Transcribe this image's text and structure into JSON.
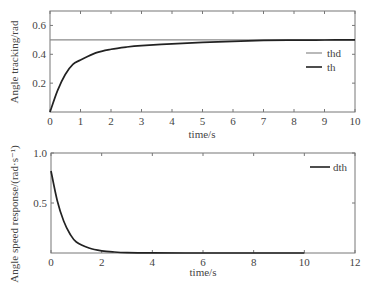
{
  "chart_data": [
    {
      "type": "line",
      "title": "",
      "xlabel": "time/s",
      "ylabel": "Angle tracking/rad",
      "xlim": [
        0,
        10
      ],
      "ylim": [
        0,
        0.7
      ],
      "xticks": [
        0,
        1,
        2,
        3,
        4,
        5,
        6,
        7,
        8,
        9,
        10
      ],
      "yticks": [
        0.2,
        0.4,
        0.6
      ],
      "grid": false,
      "legend_position": "right-middle",
      "series": [
        {
          "name": "thd",
          "color": "#8a8a8a",
          "x": [
            0,
            10
          ],
          "y": [
            0.5,
            0.5
          ]
        },
        {
          "name": "th",
          "color": "#222222",
          "x": [
            0,
            0.25,
            0.5,
            0.75,
            1,
            1.5,
            2,
            2.5,
            3,
            4,
            5,
            6,
            7,
            8,
            9,
            10
          ],
          "y": [
            0,
            0.15,
            0.26,
            0.33,
            0.36,
            0.41,
            0.435,
            0.45,
            0.46,
            0.472,
            0.482,
            0.49,
            0.496,
            0.498,
            0.499,
            0.5
          ]
        }
      ]
    },
    {
      "type": "line",
      "title": "",
      "xlabel": "time/s",
      "ylabel": "Angle speed response/(rad·s⁻¹)",
      "xlim": [
        0,
        12
      ],
      "ylim": [
        0,
        1.0
      ],
      "xticks": [
        0,
        2,
        4,
        6,
        8,
        10,
        12
      ],
      "yticks": [
        0.5,
        1.0
      ],
      "grid": false,
      "legend_position": "upper-right",
      "series": [
        {
          "name": "dth",
          "color": "#222222",
          "x": [
            0,
            0.25,
            0.5,
            0.75,
            1,
            1.5,
            2,
            2.5,
            3,
            4,
            6,
            8,
            10
          ],
          "y": [
            0.82,
            0.52,
            0.32,
            0.19,
            0.11,
            0.05,
            0.022,
            0.01,
            0.004,
            0.001,
            0,
            0,
            0
          ]
        }
      ]
    }
  ],
  "plots": {
    "top": {
      "ylabel": "Angle tracking/rad",
      "xlabel": "time/s",
      "yticklabels": [
        "0.2",
        "0.4",
        "0.6"
      ],
      "xticklabels": [
        "0",
        "1",
        "2",
        "3",
        "4",
        "5",
        "6",
        "7",
        "8",
        "9",
        "10"
      ],
      "legend": [
        "thd",
        "th"
      ]
    },
    "bottom": {
      "ylabel": "Angle speed response/(rad·s⁻¹)",
      "xlabel": "time/s",
      "yticklabels": [
        "0.5",
        "1.0"
      ],
      "xticklabels": [
        "0",
        "2",
        "4",
        "6",
        "8",
        "10",
        "12"
      ],
      "legend": [
        "dth"
      ]
    }
  }
}
